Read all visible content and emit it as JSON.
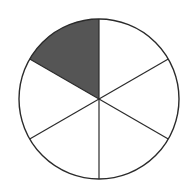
{
  "figure": {
    "name": "fraction-circle",
    "caption": "One of six equal parts shaded",
    "background_color": "#ffffff"
  },
  "geometry": {
    "center_x": 99,
    "center_y": 99,
    "radius": 80,
    "sector_count": 6,
    "sector_angle_degrees": 60,
    "shaded_sector_index": 4,
    "shaded_start_angle_degrees": 210,
    "shaded_end_angle_degrees": 270,
    "divider_count": 3,
    "divider_angles_degrees": [
      90,
      150,
      210
    ]
  },
  "style": {
    "shaded_fill": "#555555",
    "unshaded_fill": "#ffffff",
    "outline_color": "#2b2b2b",
    "outline_width": 1.4,
    "divider_color": "#2b2b2b",
    "divider_width": 1.2
  },
  "chart_data": {
    "type": "pie",
    "xlabel": "",
    "ylabel": "",
    "categories": [
      "Sector 1",
      "Sector 2",
      "Sector 3",
      "Sector 4",
      "Sector 5",
      "Sector 6"
    ],
    "values": [
      1,
      1,
      1,
      1,
      1,
      1
    ],
    "fraction_shaded": "1/6",
    "shaded_count": 1,
    "total_count": 6,
    "percent_shaded": 16.7,
    "slice_colors": [
      "#ffffff",
      "#ffffff",
      "#ffffff",
      "#ffffff",
      "#555555",
      "#ffffff"
    ],
    "slice_states": [
      "unshaded",
      "unshaded",
      "unshaded",
      "unshaded",
      "shaded",
      "unshaded"
    ],
    "slice_angle_ranges_degrees": [
      [
        330,
        30
      ],
      [
        30,
        90
      ],
      [
        90,
        150
      ],
      [
        150,
        210
      ],
      [
        210,
        270
      ],
      [
        270,
        330
      ]
    ],
    "legend": [],
    "legend_position": "none",
    "grid": false,
    "annotations": []
  },
  "sectors": [
    {
      "id": "sector-1",
      "label": "Sector 1",
      "state": "unshaded",
      "fill": "#ffffff",
      "start_angle": 330,
      "end_angle": 30
    },
    {
      "id": "sector-2",
      "label": "Sector 2",
      "state": "unshaded",
      "fill": "#ffffff",
      "start_angle": 30,
      "end_angle": 90
    },
    {
      "id": "sector-3",
      "label": "Sector 3",
      "state": "unshaded",
      "fill": "#ffffff",
      "start_angle": 90,
      "end_angle": 150
    },
    {
      "id": "sector-4",
      "label": "Sector 4",
      "state": "unshaded",
      "fill": "#ffffff",
      "start_angle": 150,
      "end_angle": 210
    },
    {
      "id": "sector-5",
      "label": "Sector 5",
      "state": "shaded",
      "fill": "#555555",
      "start_angle": 210,
      "end_angle": 270
    },
    {
      "id": "sector-6",
      "label": "Sector 6",
      "state": "unshaded",
      "fill": "#ffffff",
      "start_angle": 270,
      "end_angle": 330
    }
  ]
}
